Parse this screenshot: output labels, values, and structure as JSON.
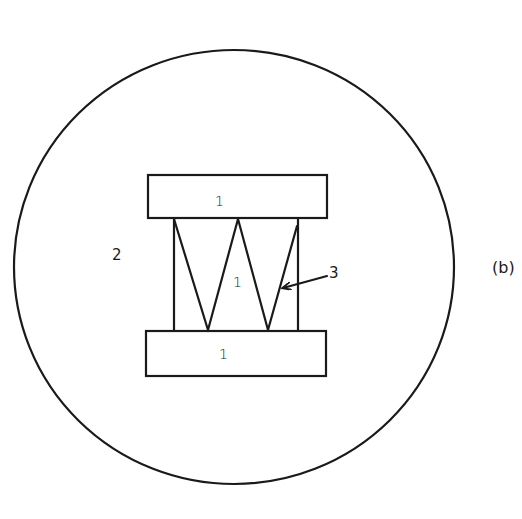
{
  "figure": {
    "caption": "(b)",
    "stroke_color": "#1a1a1a",
    "background_color": "#ffffff"
  },
  "regions": {
    "outer_circle": {
      "label": "2"
    },
    "top_block": {
      "label": "1"
    },
    "middle_region": {
      "label": "1"
    },
    "bottom_block": {
      "label": "1"
    },
    "zigzag": {
      "label": "3"
    }
  },
  "geometry": {
    "outer_circle": {
      "cx": 234,
      "cy": 267,
      "rx": 220,
      "ry": 217
    },
    "top_block": {
      "x": 148,
      "y": 175,
      "w": 179,
      "h": 43
    },
    "bottom_block": {
      "x": 146,
      "y": 331,
      "w": 180,
      "h": 45
    },
    "side_walls": {
      "left_x": 174,
      "right_x": 298,
      "top_y": 218,
      "bottom_y": 331
    },
    "zigzag_points": [
      [
        174,
        219
      ],
      [
        208,
        330
      ],
      [
        238,
        219
      ],
      [
        268,
        330
      ],
      [
        297,
        226
      ]
    ],
    "leader_arrow": {
      "from": [
        327,
        276
      ],
      "to": [
        282,
        288
      ]
    }
  }
}
